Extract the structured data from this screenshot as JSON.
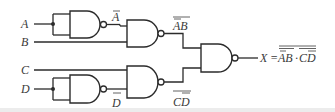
{
  "diagram": {
    "type": "logic-circuit",
    "inputs": [
      {
        "id": "A",
        "label": "A"
      },
      {
        "id": "B",
        "label": "B"
      },
      {
        "id": "C",
        "label": "C"
      },
      {
        "id": "D",
        "label": "D"
      }
    ],
    "gates": [
      {
        "id": "g1",
        "kind": "NAND",
        "inputs": [
          "A",
          "A"
        ],
        "output_label": "A",
        "output_overlines": "A"
      },
      {
        "id": "g2",
        "kind": "NAND",
        "inputs": [
          "g1",
          "B"
        ],
        "output_label": "AB",
        "output_overlines": "whole, A"
      },
      {
        "id": "g3",
        "kind": "NAND",
        "inputs": [
          "D",
          "D"
        ],
        "output_label": "D",
        "output_overlines": "D"
      },
      {
        "id": "g4",
        "kind": "NAND",
        "inputs": [
          "C",
          "g3"
        ],
        "output_label": "CD",
        "output_overlines": "whole, D"
      },
      {
        "id": "g5",
        "kind": "NAND",
        "inputs": [
          "g2",
          "g4"
        ],
        "output_label": "X"
      }
    ],
    "labels": {
      "a": "A",
      "b": "B",
      "c": "C",
      "d": "D",
      "a_bar": "A",
      "ab_text": "AB",
      "d_bar": "D",
      "cd_text": "CD",
      "x": "X",
      "eq": "=",
      "expr_ab": "AB",
      "dot": "·",
      "expr_cd": "CD"
    },
    "output_expression": "X = NOT( NOT(A̅·B) · NOT(C·D̅) )",
    "colors": {
      "line": "#2b2b2b",
      "text": "#3a3a3a"
    }
  }
}
